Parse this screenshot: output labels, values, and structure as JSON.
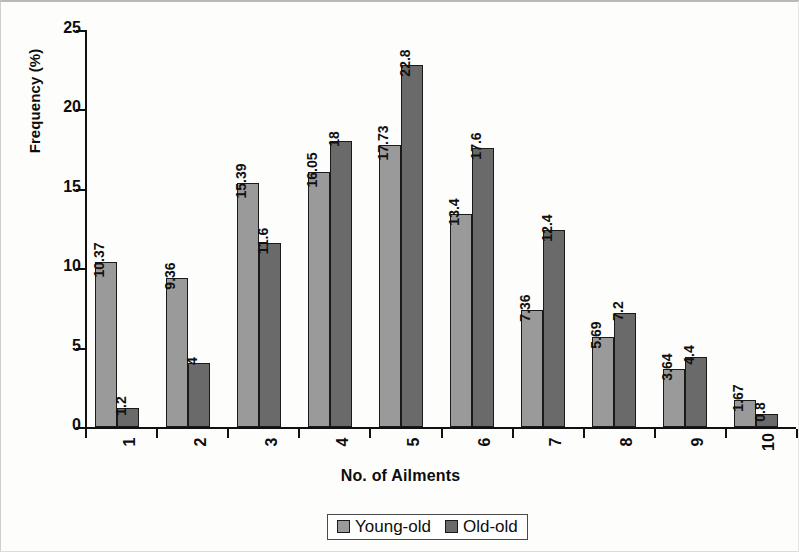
{
  "chart_data": {
    "type": "bar",
    "title": "",
    "xlabel": "No. of  Ailments",
    "ylabel": "Frequency (%)",
    "categories": [
      "1",
      "2",
      "3",
      "4",
      "5",
      "6",
      "7",
      "8",
      "9",
      "10"
    ],
    "series": [
      {
        "name": "Young-old",
        "color": "#9a9a9a",
        "values": [
          10.37,
          9.36,
          15.39,
          16.05,
          17.73,
          13.4,
          7.36,
          5.69,
          3.64,
          1.67
        ],
        "labels": [
          "10.37",
          "9.36",
          "15.39",
          "16.05",
          "17.73",
          "13.4",
          "7.36",
          "5.69",
          "3.64",
          "1.67"
        ]
      },
      {
        "name": "Old-old",
        "color": "#6a6a6a",
        "values": [
          1.2,
          4,
          11.6,
          18,
          22.8,
          17.6,
          12.4,
          7.2,
          4.4,
          0.8
        ],
        "labels": [
          "1.2",
          "4",
          "11.6",
          "18",
          "22.8",
          "17.6",
          "12.4",
          "7.2",
          "4.4",
          "0.8"
        ]
      }
    ],
    "ylim": [
      0,
      25
    ],
    "yticks": [
      0,
      5,
      10,
      15,
      20,
      25
    ],
    "ytick_labels": [
      "0",
      "5",
      "10",
      "15",
      "20",
      "25"
    ],
    "grid": false,
    "legend_position": "bottom-center",
    "data_labels_rotation": 90,
    "xtick_label_rotation": 90
  }
}
